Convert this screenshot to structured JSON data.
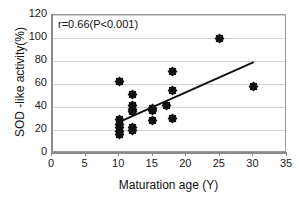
{
  "chart_data": {
    "type": "scatter",
    "title": "",
    "xlabel": "Maturation age (Y)",
    "ylabel": "SOD -like activity(%)",
    "xlim": [
      0,
      35
    ],
    "ylim": [
      0,
      120
    ],
    "xticks": [
      0,
      5,
      10,
      15,
      20,
      25,
      30,
      35
    ],
    "yticks": [
      0,
      20,
      40,
      60,
      80,
      100,
      120
    ],
    "grid": "horizontal",
    "legend": "none",
    "annotation": "r=0.66(P<0.001)",
    "correlation_r": 0.66,
    "p_value_text": "P<0.001",
    "marker": "diamond",
    "marker_color": "#111111",
    "points": [
      {
        "x": 10,
        "y": 16
      },
      {
        "x": 10,
        "y": 19
      },
      {
        "x": 10,
        "y": 22
      },
      {
        "x": 10,
        "y": 25
      },
      {
        "x": 10,
        "y": 29
      },
      {
        "x": 10,
        "y": 62
      },
      {
        "x": 12,
        "y": 20
      },
      {
        "x": 12,
        "y": 22
      },
      {
        "x": 12,
        "y": 36
      },
      {
        "x": 12,
        "y": 38
      },
      {
        "x": 12,
        "y": 41
      },
      {
        "x": 12,
        "y": 51
      },
      {
        "x": 15,
        "y": 28
      },
      {
        "x": 15,
        "y": 37
      },
      {
        "x": 15,
        "y": 39
      },
      {
        "x": 17,
        "y": 41
      },
      {
        "x": 18,
        "y": 30
      },
      {
        "x": 18,
        "y": 54
      },
      {
        "x": 18,
        "y": 71
      },
      {
        "x": 25,
        "y": 100
      },
      {
        "x": 30,
        "y": 58
      }
    ],
    "trendline": {
      "x_start": 10,
      "y_start": 28,
      "x_end": 30,
      "y_end": 80,
      "color": "#111111"
    }
  },
  "colors": {
    "grid": "#d0d0d0",
    "frame": "#9a9a9a",
    "axis": "#8a8a8a",
    "text": "#111111",
    "background": "#ffffff"
  }
}
